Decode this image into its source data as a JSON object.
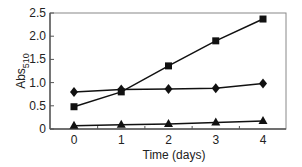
{
  "chart_data": {
    "type": "line",
    "title": "",
    "xlabel": "Time (days)",
    "ylabel": "Abs510",
    "ylabel_main": "Abs",
    "ylabel_sub": "510",
    "x": [
      0,
      1,
      2,
      3,
      4
    ],
    "xticks": [
      "0",
      "1",
      "2",
      "3",
      "4"
    ],
    "yticks": [
      "0",
      "0.5",
      "1.0",
      "1.5",
      "2.0",
      "2.5"
    ],
    "ylim": [
      0,
      2.5
    ],
    "xlim": [
      -0.5,
      4.5
    ],
    "grid": false,
    "legend": "none",
    "series": [
      {
        "name": "square",
        "marker": "square",
        "values": [
          0.48,
          0.8,
          1.36,
          1.9,
          2.37
        ]
      },
      {
        "name": "diamond",
        "marker": "diamond",
        "values": [
          0.8,
          0.85,
          0.86,
          0.88,
          0.98
        ]
      },
      {
        "name": "triangle",
        "marker": "triangle",
        "values": [
          0.07,
          0.09,
          0.11,
          0.14,
          0.17
        ]
      }
    ]
  },
  "colors": {
    "line": "#111111",
    "axis": "#555555"
  }
}
